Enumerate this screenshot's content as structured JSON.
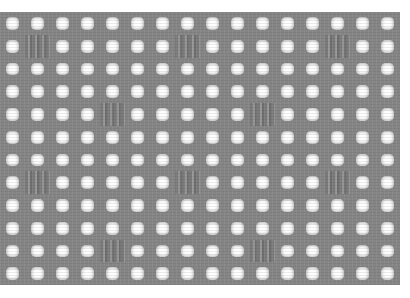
{
  "image": {
    "subject": "filet crochet mesh swatch",
    "colors": {
      "yarn": "#858585",
      "background": "#ffffff"
    },
    "grid": {
      "columns": 16,
      "rows": 12,
      "filled_blocks": [
        {
          "row": 1,
          "col": 1
        },
        {
          "row": 1,
          "col": 7
        },
        {
          "row": 1,
          "col": 13
        },
        {
          "row": 4,
          "col": 4
        },
        {
          "row": 4,
          "col": 10
        },
        {
          "row": 7,
          "col": 1
        },
        {
          "row": 7,
          "col": 7
        },
        {
          "row": 7,
          "col": 13
        },
        {
          "row": 10,
          "col": 4
        },
        {
          "row": 10,
          "col": 10
        }
      ]
    }
  }
}
